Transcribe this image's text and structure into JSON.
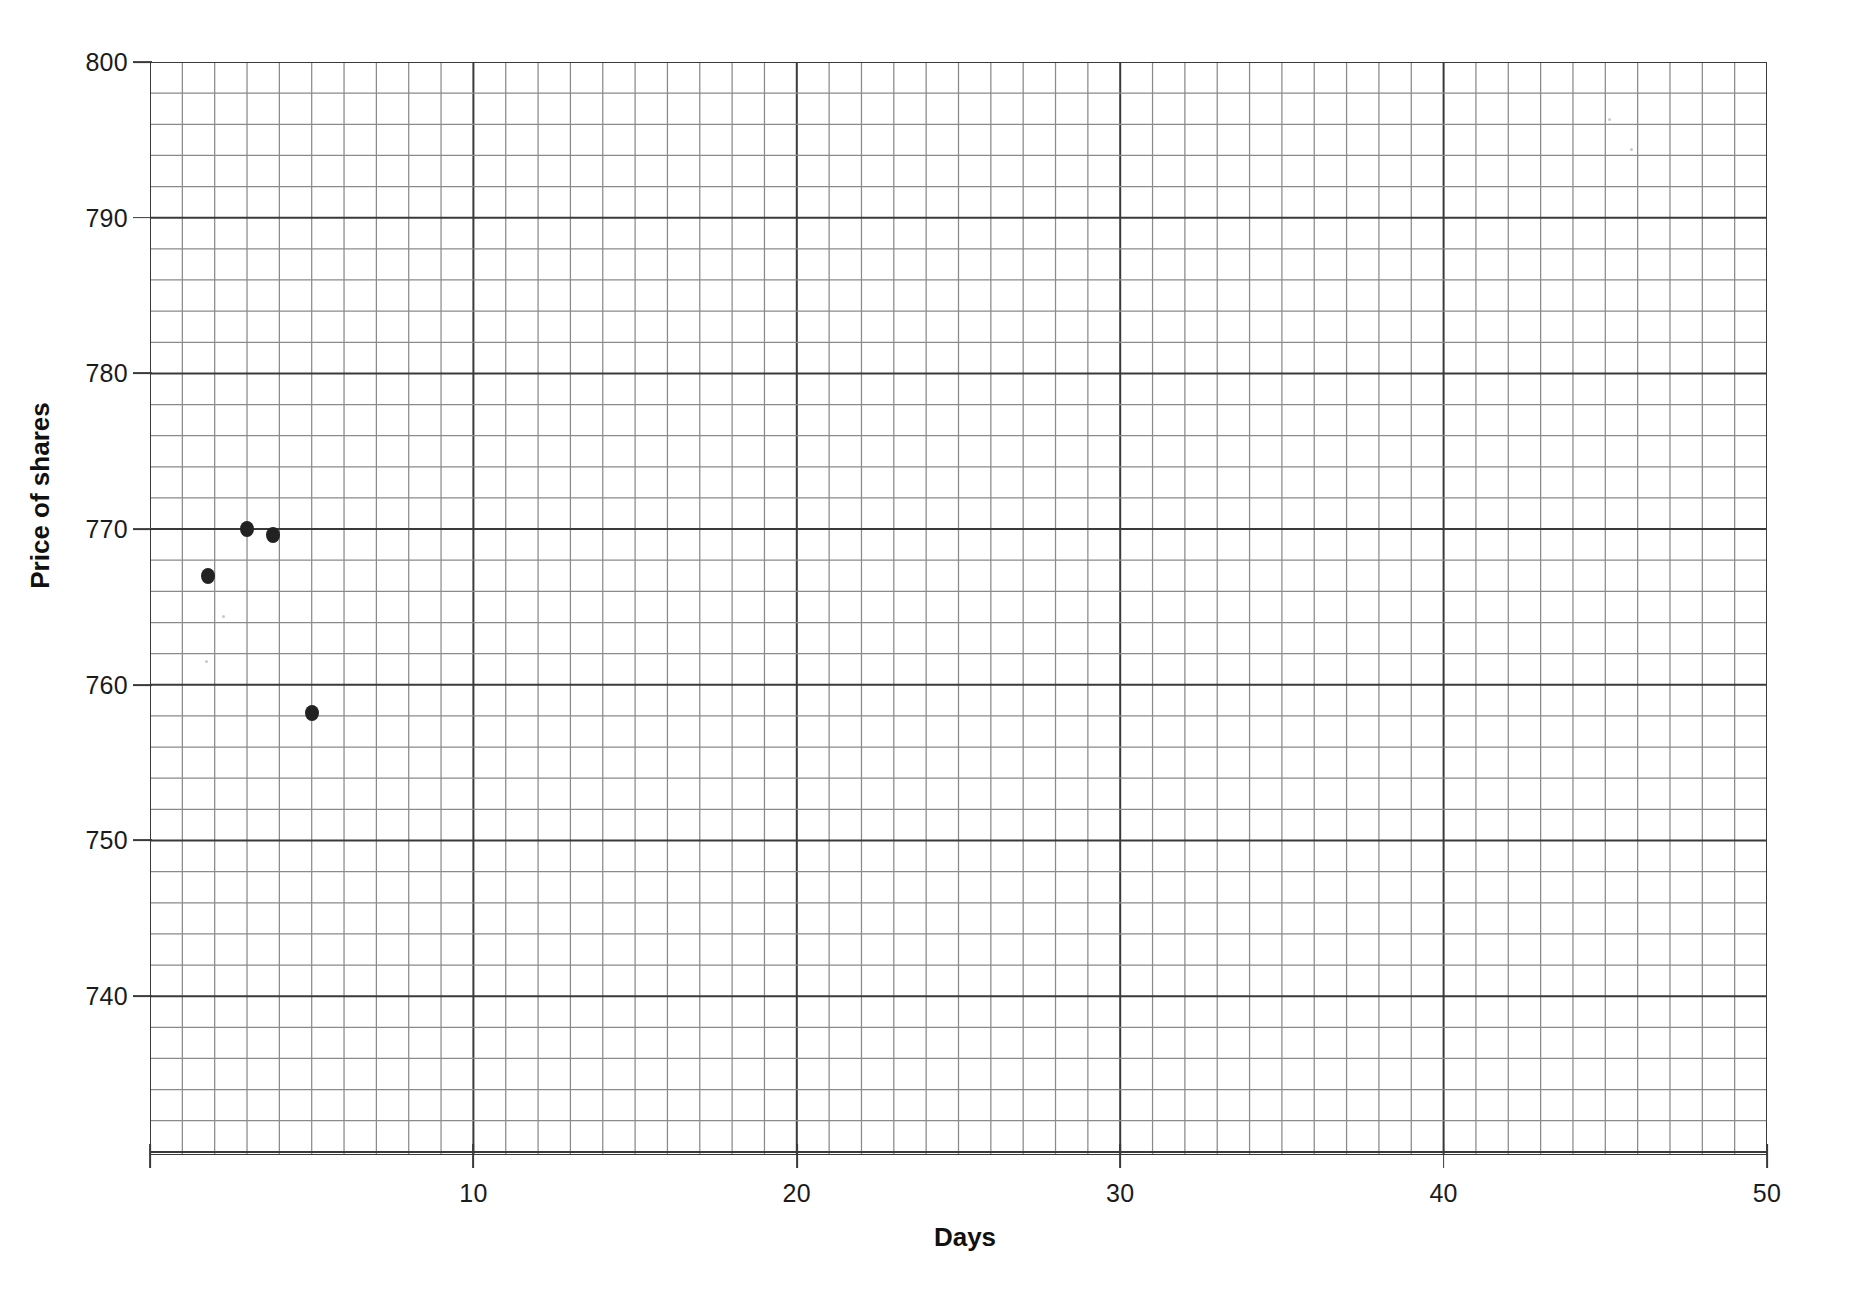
{
  "chart_data": {
    "type": "scatter",
    "title": "",
    "xlabel": "Days",
    "ylabel": "Price of shares",
    "xlim": [
      0,
      50
    ],
    "ylim": [
      729.8,
      800
    ],
    "grid": true,
    "legend": "none",
    "x_major_ticks": [
      0,
      10,
      20,
      30,
      40,
      50
    ],
    "x_tick_labels": [
      "",
      "10",
      "20",
      "30",
      "40",
      "50"
    ],
    "y_major_ticks": [
      740,
      750,
      760,
      770,
      780,
      790,
      800
    ],
    "y_tick_labels": [
      "740",
      "750",
      "760",
      "770",
      "780",
      "790",
      "800"
    ],
    "x_minor_step": 1,
    "y_minor_step": 2,
    "series": [
      {
        "name": "Price of shares",
        "marker": "filled-circle",
        "color": "#222222",
        "points": [
          {
            "x": 1.8,
            "y": 767.0
          },
          {
            "x": 3.0,
            "y": 770.0
          },
          {
            "x": 3.8,
            "y": 769.6
          },
          {
            "x": 5.0,
            "y": 758.2
          }
        ]
      }
    ]
  },
  "axes": {
    "x_title": "Days",
    "y_title": "Price of shares"
  },
  "ticks": {
    "y": [
      {
        "label": "800",
        "value": 800
      },
      {
        "label": "790",
        "value": 790
      },
      {
        "label": "780",
        "value": 780
      },
      {
        "label": "770",
        "value": 770
      },
      {
        "label": "760",
        "value": 760
      },
      {
        "label": "750",
        "value": 750
      },
      {
        "label": "740",
        "value": 740
      }
    ],
    "x": [
      {
        "label": "",
        "value": 0
      },
      {
        "label": "10",
        "value": 10
      },
      {
        "label": "20",
        "value": 20
      },
      {
        "label": "30",
        "value": 30
      },
      {
        "label": "40",
        "value": 40
      },
      {
        "label": "50",
        "value": 50
      }
    ]
  },
  "style": {
    "grid_minor_color": "#8a8a8a",
    "grid_major_color": "#3a3a3a",
    "axis_color": "#3a3a3a",
    "text_color": "#1b1b1b",
    "marker_color": "#222222",
    "background": "#ffffff"
  }
}
